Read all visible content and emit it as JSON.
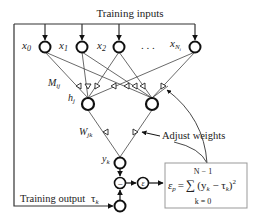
{
  "title": "Training inputs",
  "inputs": [
    {
      "name": "x",
      "sub": "0",
      "cx": 45
    },
    {
      "name": "x",
      "sub": "1",
      "cx": 82
    },
    {
      "name": "x",
      "sub": "2",
      "cx": 119
    },
    {
      "name": "x",
      "sub": "N",
      "subsub": "i",
      "cx": 195
    }
  ],
  "ellipsis": ". . .",
  "hidden_weight_label": {
    "name": "M",
    "sub": "ij"
  },
  "hidden_node_label": {
    "name": "h",
    "sub": "j"
  },
  "output_weight_label": {
    "name": "W",
    "sub": "jk"
  },
  "output_node_label": {
    "name": "y",
    "sub": "k"
  },
  "adjust_label": "Adjust weights",
  "training_output_label": "Training output",
  "tau_label": {
    "name": "τ",
    "sub": "k"
  },
  "minus_symbol": "−",
  "epsilon_symbol": "ε",
  "formula": {
    "lhs": "ε",
    "lhs_sub": "p",
    "equals": "=",
    "sum": "∑",
    "upper": "N − 1",
    "lower": "k = 0",
    "body": "(y",
    "body_sub": "k",
    "body_mid": " − τ",
    "body_sub2": "k",
    "body_end": ")",
    "power": "2"
  },
  "colors": {
    "line": "#333333",
    "node": "#111111",
    "box": "#888888"
  }
}
